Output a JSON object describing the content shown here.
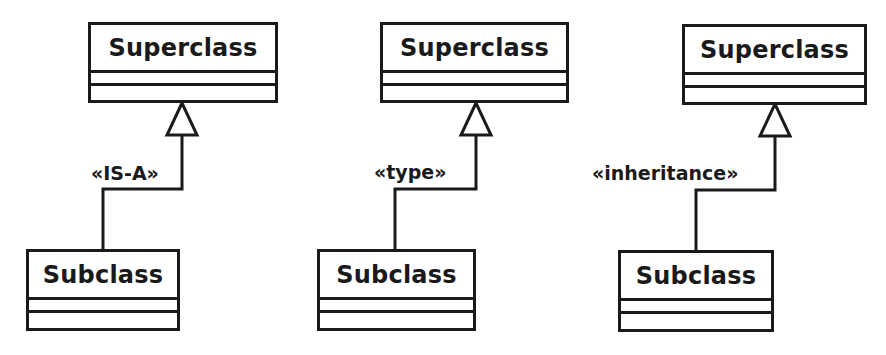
{
  "diagram": {
    "type": "uml-generalization",
    "colors": {
      "line": "#1a1a1a",
      "background": "#ffffff",
      "box_fill": "#ffffff"
    },
    "groups": [
      {
        "superclass": {
          "name": "Superclass",
          "attributes": [],
          "operations": []
        },
        "subclass": {
          "name": "Subclass",
          "attributes": [],
          "operations": []
        },
        "relationship": {
          "kind": "generalization",
          "arrowhead": "hollow-triangle",
          "stereotype": "«IS-A»"
        }
      },
      {
        "superclass": {
          "name": "Superclass",
          "attributes": [],
          "operations": []
        },
        "subclass": {
          "name": "Subclass",
          "attributes": [],
          "operations": []
        },
        "relationship": {
          "kind": "generalization",
          "arrowhead": "hollow-triangle",
          "stereotype": "«type»"
        }
      },
      {
        "superclass": {
          "name": "Superclass",
          "attributes": [],
          "operations": []
        },
        "subclass": {
          "name": "Subclass",
          "attributes": [],
          "operations": []
        },
        "relationship": {
          "kind": "generalization",
          "arrowhead": "hollow-triangle",
          "stereotype": "«inheritance»"
        }
      }
    ]
  }
}
